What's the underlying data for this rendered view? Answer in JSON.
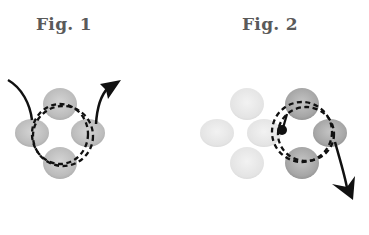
{
  "figures": [
    {
      "label": "Fig. 1",
      "blobs": [
        {
          "id": "top",
          "cx": 60,
          "cy": 103,
          "shade": "medium"
        },
        {
          "id": "left",
          "cx": 32,
          "cy": 133,
          "shade": "medium"
        },
        {
          "id": "right",
          "cx": 88,
          "cy": 133,
          "shade": "medium"
        },
        {
          "id": "bottom",
          "cx": 60,
          "cy": 163,
          "shade": "medium"
        }
      ],
      "arrow": {
        "direction": "in-top-left, out-top-right"
      }
    },
    {
      "label": "Fig. 2",
      "blobs": [
        {
          "id": "light-top",
          "cx": 247,
          "cy": 103,
          "shade": "light"
        },
        {
          "id": "light-left",
          "cx": 217,
          "cy": 133,
          "shade": "light"
        },
        {
          "id": "light-center",
          "cx": 263,
          "cy": 133,
          "shade": "light"
        },
        {
          "id": "light-bottom",
          "cx": 247,
          "cy": 163,
          "shade": "light"
        },
        {
          "id": "dark-top",
          "cx": 302,
          "cy": 103,
          "shade": "dark"
        },
        {
          "id": "dark-right",
          "cx": 330,
          "cy": 133,
          "shade": "dark"
        },
        {
          "id": "dark-bottom",
          "cx": 302,
          "cy": 163,
          "shade": "dark"
        }
      ],
      "marker": {
        "type": "dot",
        "cx": 282,
        "cy": 130
      },
      "arrow": {
        "direction": "out-bottom-right"
      }
    }
  ],
  "colors": {
    "label": "#5a5a5a",
    "blob_medium": "#bdbdbd",
    "blob_light": "#e6e6e6",
    "blob_dark": "#a8a8a8",
    "stroke": "#111111"
  }
}
